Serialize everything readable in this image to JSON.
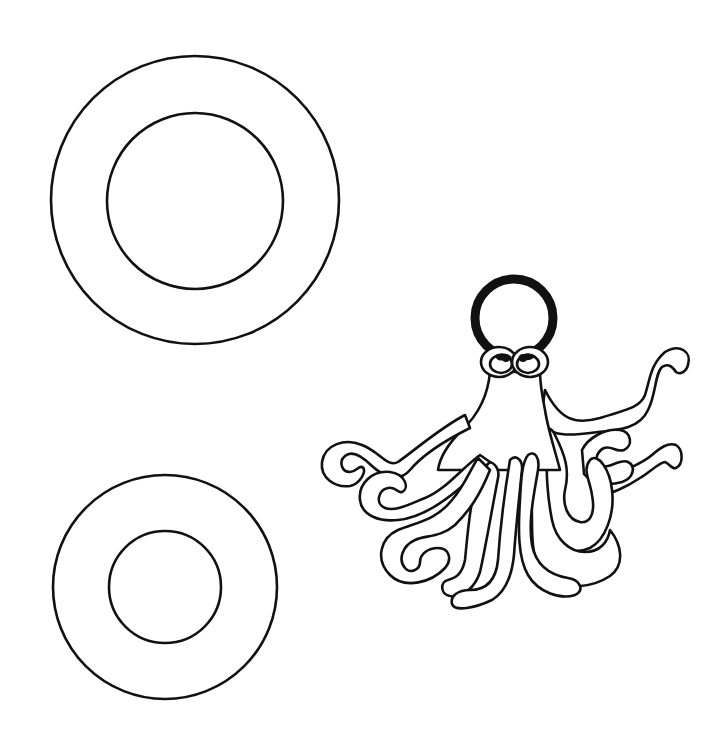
{
  "page": {
    "background": "#ffffff",
    "line_color": "#111111"
  },
  "figures": {
    "large_ring": {
      "label": "large ring",
      "cx": 195,
      "cy": 200,
      "outer_r": 144,
      "inner_r": 88
    },
    "small_ring": {
      "label": "small ring",
      "cx": 165,
      "cy": 587,
      "outer_r": 111,
      "inner_r": 56
    },
    "octopus": {
      "label": "octopus wearing a ring on its head",
      "head_ring": {
        "cx": 514,
        "cy": 318,
        "r": 40,
        "stroke": 9
      },
      "eyes": [
        {
          "cx": 498,
          "cy": 362
        },
        {
          "cx": 531,
          "cy": 362
        }
      ],
      "tentacle_count": 8
    }
  }
}
